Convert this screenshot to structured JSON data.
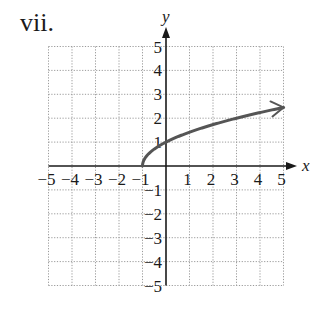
{
  "title": "vii.",
  "colors": {
    "grid": "#9a9a9a",
    "axis": "#1a1a1a",
    "curve": "#555555",
    "text": "#1a1a1a"
  },
  "chart_data": {
    "type": "line",
    "title": "vii.",
    "xlabel": "x",
    "ylabel": "y",
    "xlim": [
      -5,
      5
    ],
    "ylim": [
      -5,
      5
    ],
    "grid": true,
    "x_ticks": [
      -5,
      -4,
      -3,
      -2,
      -1,
      1,
      2,
      3,
      4,
      5
    ],
    "y_ticks": [
      -5,
      -4,
      -3,
      -2,
      -1,
      1,
      2,
      3,
      4,
      5
    ],
    "x_tick_labels": [
      "−5",
      "−4",
      "−3",
      "−2",
      "−1",
      "1",
      "2",
      "3",
      "4",
      "5"
    ],
    "y_tick_labels": [
      "−5",
      "−4",
      "−3",
      "−2",
      "−1",
      "1",
      "2",
      "3",
      "4",
      "5"
    ],
    "function": "y = sqrt(x + 1)",
    "series": [
      {
        "name": "y = √(x+1)",
        "x": [
          -1,
          -0.75,
          -0.5,
          0,
          1,
          2,
          3,
          4,
          5
        ],
        "y": [
          0,
          0.5,
          0.71,
          1,
          1.41,
          1.73,
          2,
          2.24,
          2.45
        ],
        "start_point": [
          -1,
          0
        ],
        "end_arrow": true
      }
    ]
  }
}
